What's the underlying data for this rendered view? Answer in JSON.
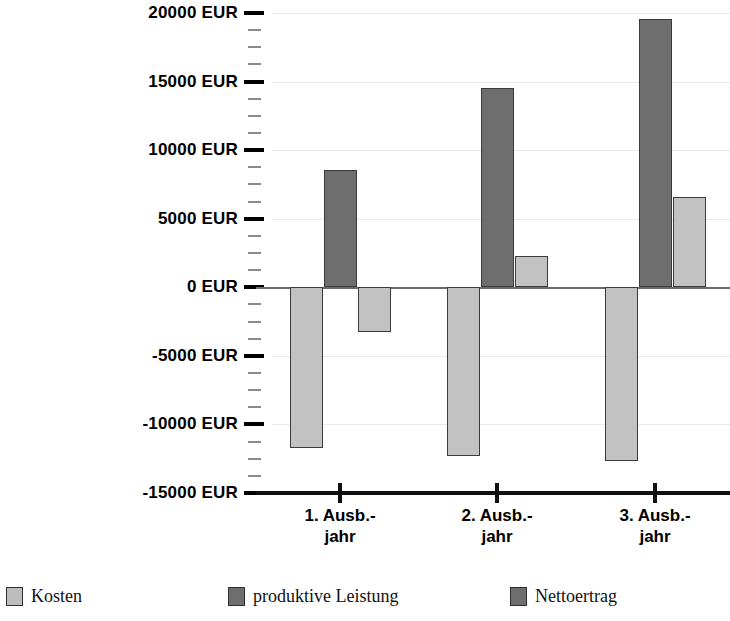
{
  "chart_data": {
    "type": "bar",
    "title": "",
    "xlabel": "",
    "ylabel": "",
    "categories": [
      "1. Ausb.-\njahr",
      "2. Ausb.-\njahr",
      "3. Ausb.-\njahr"
    ],
    "series": [
      {
        "name": "Kosten",
        "color": "#c2c2c2",
        "values": [
          -11700,
          -12300,
          -12700
        ]
      },
      {
        "name": "produktive Leistung",
        "color": "#6e6e6e",
        "values": [
          8550,
          14500,
          19550
        ]
      },
      {
        "name": "Nettoertrag",
        "color": "#c2c2c2",
        "values": [
          -3250,
          2300,
          6550
        ]
      }
    ],
    "ylim": [
      -15000,
      20000
    ],
    "ytick_values": [
      20000,
      15000,
      10000,
      5000,
      0,
      -5000,
      -10000,
      -15000
    ],
    "ytick_labels": [
      "20000 EUR",
      "15000 EUR",
      "10000 EUR",
      "5000 EUR",
      "0 EUR",
      "-5000 EUR",
      "-10000 EUR",
      "-15000 EUR"
    ],
    "yminor_step": 1250,
    "grid": true,
    "legend_position": "bottom"
  },
  "legend": {
    "items": [
      {
        "label": "Kosten",
        "swatch": "light"
      },
      {
        "label": "produktive Leistung",
        "swatch": "dark"
      },
      {
        "label": "Nettoertrag",
        "swatch": "dark"
      }
    ]
  },
  "axis": {
    "x_labels": [
      "1. Ausb.-\njahr",
      "2. Ausb.-\njahr",
      "3. Ausb.-\njahr"
    ]
  }
}
